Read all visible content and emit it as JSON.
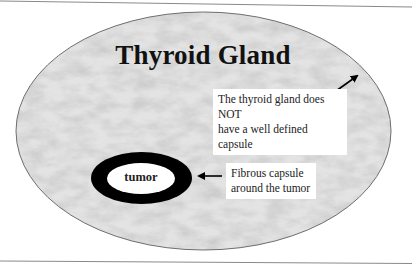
{
  "diagram": {
    "title": "Thyroid Gland",
    "gland_label": "The thyroid gland does NOT have a well defined capsule",
    "gland_label_lines": [
      "The thyroid gland does NOT",
      "have a well defined capsule"
    ],
    "tumor_label": "tumor",
    "capsule_label": "Fibrous capsule around the tumor",
    "capsule_label_lines": [
      "Fibrous capsule",
      "around the tumor"
    ],
    "colors": {
      "gland_fill": "#d9d9d9",
      "gland_outline": "#6e6e6e",
      "capsule_ring": "#000000",
      "tumor_fill": "#ffffff",
      "rule_lines": "#8a8a8a"
    }
  }
}
